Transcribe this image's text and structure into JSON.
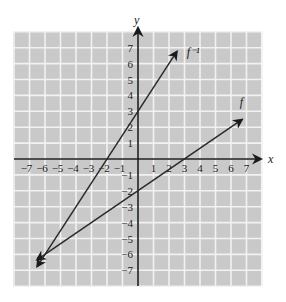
{
  "chart_data": {
    "type": "line",
    "title": "",
    "xlabel": "x",
    "ylabel": "y",
    "xlim": [
      -8,
      8
    ],
    "ylim": [
      -8,
      8
    ],
    "grid": true,
    "x_ticks": [
      -7,
      -6,
      -5,
      -4,
      -3,
      -2,
      -1,
      1,
      2,
      3,
      4,
      5,
      6,
      7
    ],
    "y_ticks": [
      -7,
      -6,
      -5,
      -4,
      -3,
      -2,
      -1,
      1,
      2,
      3,
      4,
      5,
      6,
      7
    ],
    "x_tick_labels": [
      "−7",
      "−6",
      "−5",
      "−4",
      "−3",
      "−2",
      "−1",
      "1",
      "2",
      "3",
      "4",
      "5",
      "6",
      "7"
    ],
    "y_tick_labels": [
      "−7",
      "−6",
      "−5",
      "−4",
      "−3",
      "−2",
      "−1",
      "1",
      "2",
      "3",
      "4",
      "5",
      "6",
      "7"
    ],
    "series": [
      {
        "name": "f",
        "label": "f",
        "equation": "y = (2/3)x - 2",
        "x": [
          -6.5,
          6.7
        ],
        "y": [
          -6.33,
          2.47
        ],
        "points_of_note": [
          [
            0,
            -2
          ],
          [
            3,
            0
          ],
          [
            -6,
            -6
          ]
        ],
        "arrows": "both"
      },
      {
        "name": "f_inverse",
        "label": "f⁻¹",
        "equation": "y = (3/2)x + 3",
        "x": [
          -6.5,
          2.5
        ],
        "y": [
          -6.75,
          6.75
        ],
        "points_of_note": [
          [
            0,
            3
          ],
          [
            -2,
            0
          ],
          [
            -6,
            -6
          ]
        ],
        "arrows": "both"
      }
    ],
    "colors": {
      "grid_background": "#c9c9c9",
      "grid_lines": "#f2f2f2",
      "axes": "#1a1a1a",
      "lines": "#2a2a2a"
    }
  }
}
